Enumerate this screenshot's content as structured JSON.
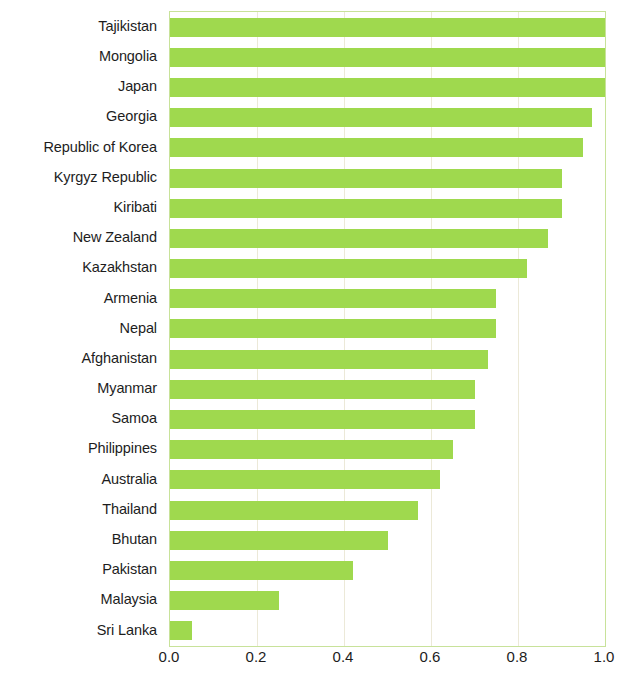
{
  "chart_data": {
    "type": "bar",
    "orientation": "horizontal",
    "title": "",
    "subtitle": "",
    "xlabel": "",
    "ylabel": "",
    "xlim": [
      0.0,
      1.0
    ],
    "xticks": [
      "0.0",
      "0.2",
      "0.4",
      "0.6",
      "0.8",
      "1.0"
    ],
    "xtick_values": [
      0.0,
      0.2,
      0.4,
      0.6,
      0.8,
      1.0
    ],
    "grid": "vertical",
    "legend": "none",
    "bar_color": "#9fd94e",
    "grid_color": "#ece9d8",
    "axis_color": "#c8e29a",
    "text_color": "#1d1d1d",
    "categories": [
      "Tajikistan",
      "Mongolia",
      "Japan",
      "Georgia",
      "Republic of Korea",
      "Kyrgyz Republic",
      "Kiribati",
      "New Zealand",
      "Kazakhstan",
      "Armenia",
      "Nepal",
      "Afghanistan",
      "Myanmar",
      "Samoa",
      "Philippines",
      "Australia",
      "Thailand",
      "Bhutan",
      "Pakistan",
      "Malaysia",
      "Sri Lanka"
    ],
    "values": [
      1.0,
      1.0,
      1.0,
      0.97,
      0.95,
      0.9,
      0.9,
      0.87,
      0.82,
      0.75,
      0.75,
      0.73,
      0.7,
      0.7,
      0.65,
      0.62,
      0.57,
      0.5,
      0.42,
      0.25,
      0.05
    ]
  }
}
